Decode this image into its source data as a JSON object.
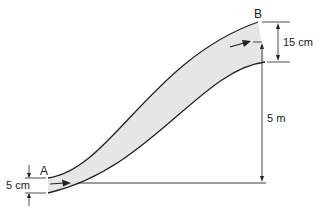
{
  "diagram": {
    "colors": {
      "pipe_fill": "#e6e6e6",
      "line": "#222222"
    },
    "labels": {
      "point_a": "A",
      "point_b": "B",
      "diameter_a": "5 cm",
      "diameter_b": "15 cm",
      "elevation": "5 m"
    }
  }
}
